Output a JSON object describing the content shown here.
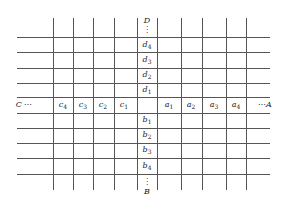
{
  "diagram": {
    "type": "grid-intersection",
    "line_color": "#555555",
    "background": "#ffffff",
    "horizontal_lines_y": [
      37,
      52,
      68,
      83,
      97,
      113,
      128,
      143,
      158,
      174
    ],
    "horizontal_x_range": [
      17,
      270
    ],
    "vertical_lines_x": [
      53,
      73,
      93,
      114,
      137,
      157,
      181,
      202,
      226,
      246
    ],
    "vertical_y_range": [
      18,
      190
    ],
    "endpoints": {
      "top": {
        "letter": "D",
        "dots": "⋮"
      },
      "bottom": {
        "letter": "B",
        "dots": "⋮"
      },
      "left": {
        "letter": "C",
        "dots": "⋯"
      },
      "right": {
        "letter": "A",
        "dots": "⋯"
      }
    },
    "column_labels_up": [
      {
        "base": "d",
        "sub": "4"
      },
      {
        "base": "d",
        "sub": "3"
      },
      {
        "base": "d",
        "sub": "2"
      },
      {
        "base": "d",
        "sub": "1"
      }
    ],
    "column_labels_down": [
      {
        "base": "b",
        "sub": "1"
      },
      {
        "base": "b",
        "sub": "2"
      },
      {
        "base": "b",
        "sub": "3"
      },
      {
        "base": "b",
        "sub": "4"
      }
    ],
    "row_labels_left": [
      {
        "base": "c",
        "sub": "4"
      },
      {
        "base": "c",
        "sub": "3"
      },
      {
        "base": "c",
        "sub": "2"
      },
      {
        "base": "c",
        "sub": "1"
      }
    ],
    "row_labels_right": [
      {
        "base": "a",
        "sub": "1"
      },
      {
        "base": "a",
        "sub": "2"
      },
      {
        "base": "a",
        "sub": "3"
      },
      {
        "base": "a",
        "sub": "4"
      }
    ]
  }
}
